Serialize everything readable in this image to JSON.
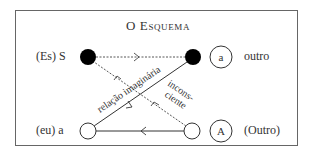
{
  "title": "O Esquema",
  "nodes": {
    "top_left": {
      "label": "(Es) S",
      "fill": "#000000"
    },
    "top_right": {
      "label": "outro",
      "circle_letter": "a",
      "fill": "#000000"
    },
    "bottom_left": {
      "label": "(eu) a",
      "fill": "#ffffff"
    },
    "bottom_right": {
      "label": "(Outro)",
      "circle_letter": "A",
      "fill": "#ffffff"
    }
  },
  "edges": {
    "imaginary": "relação imaginária",
    "unconscious_line1": "incons-",
    "unconscious_line2": "ciente"
  },
  "colors": {
    "line": "#333333",
    "frame": "#666666"
  }
}
